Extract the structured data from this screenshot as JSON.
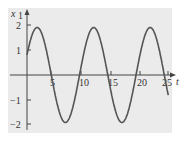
{
  "chart_data": {
    "type": "line",
    "title": "",
    "xlabel": "t",
    "ylabel": "x1",
    "xlim": [
      0,
      25.5
    ],
    "ylim": [
      -2.1,
      2.1
    ],
    "grid": false,
    "legend": null,
    "x_ticks": [
      "5",
      "10",
      "15",
      "20",
      "25"
    ],
    "y_ticks": [
      "2",
      "1",
      "-1",
      "-2"
    ],
    "series": [
      {
        "name": "x1(t)",
        "x": [
          0,
          1,
          2,
          3,
          4,
          5,
          6,
          7,
          8,
          9,
          10,
          11,
          12,
          13,
          14,
          15,
          16,
          17,
          18,
          19,
          20,
          21,
          22,
          23,
          24,
          25
        ],
        "values": [
          1.0,
          1.7,
          1.85,
          1.5,
          0.6,
          -0.5,
          -1.5,
          -1.9,
          -1.6,
          -0.7,
          0.5,
          1.5,
          1.85,
          1.5,
          0.6,
          -0.5,
          -1.5,
          -1.9,
          -1.6,
          -0.7,
          0.5,
          1.5,
          1.85,
          1.5,
          0.6,
          -1.2
        ]
      }
    ],
    "curve": {
      "amplitude": 1.9,
      "period": 10,
      "phase_peak_t": 1.8
    }
  },
  "labels": {
    "y_axis": "x",
    "y_axis_sub": "1",
    "x_axis": "t",
    "xt5": "5",
    "xt10": "10",
    "xt15": "15",
    "xt20": "20",
    "xt25": "25",
    "yt2": "2",
    "yt1": "1",
    "ytm1": "−1",
    "ytm2": "−2"
  },
  "colors": {
    "panel": "#ebebeb",
    "axis": "#444444",
    "curve": "#555555"
  }
}
